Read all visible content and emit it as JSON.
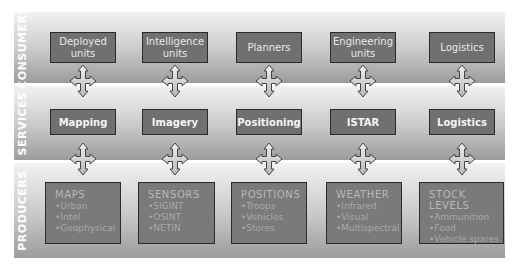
{
  "layers": [
    {
      "label": "CONSUMERS",
      "items": [
        {
          "label": "Deployed units"
        },
        {
          "label": "Intelligence units"
        },
        {
          "label": "Planners"
        },
        {
          "label": "Engineering units"
        },
        {
          "label": "Logistics"
        }
      ]
    },
    {
      "label": "SERVICES",
      "items": [
        {
          "label": "Mapping"
        },
        {
          "label": "Imagery"
        },
        {
          "label": "Positioning"
        },
        {
          "label": "ISTAR"
        },
        {
          "label": "Logistics"
        }
      ]
    },
    {
      "label": "PRODUCERS",
      "items": [
        {
          "title": "MAPS",
          "bullets": [
            "•Urban",
            "•Intel",
            "•Geophysical"
          ]
        },
        {
          "title": "SENSORS",
          "bullets": [
            "•SIGINT",
            "•OSINT",
            "•NETIN"
          ]
        },
        {
          "title": "POSITIONS",
          "bullets": [
            "•Troops",
            "•Vehicles",
            "•Stores"
          ]
        },
        {
          "title": "WEATHER",
          "bullets": [
            "•Infrared",
            "•Visual",
            "•Multispectral"
          ]
        },
        {
          "title": "STOCK LEVELS",
          "bullets": [
            "•Ammunition",
            "•Food",
            "•Vehicle spares"
          ]
        }
      ]
    }
  ],
  "connector_icon": "four-way-arrow-icon",
  "colors": {
    "box_fill": "#707070",
    "box_border": "#2b2b2b",
    "band_top": "#f2f2f2",
    "band_bottom": "#9c9c9c",
    "arrow_fill": "#d8d8d8",
    "arrow_stroke": "#444444"
  }
}
